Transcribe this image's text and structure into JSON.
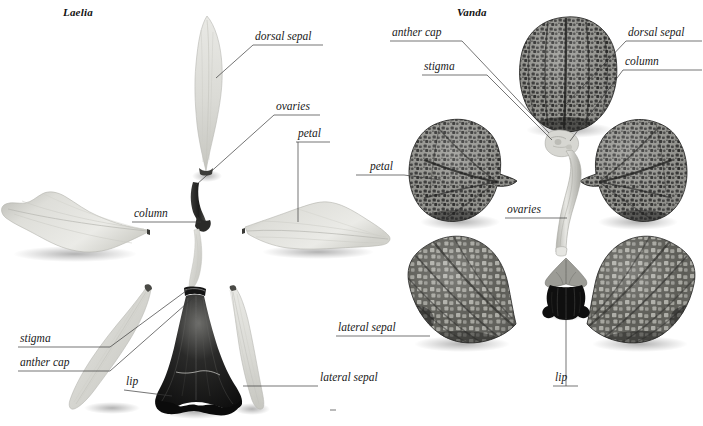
{
  "plate": {
    "width": 703,
    "height": 426,
    "background_color": "#ffffff",
    "description": "Comparative botanical dissection plate of two orchid genera showing separated floral parts"
  },
  "genera": [
    {
      "id": "laelia",
      "name": "Laelia",
      "x": 63,
      "y": 7
    },
    {
      "id": "vanda",
      "name": "Vanda",
      "x": 457,
      "y": 7
    }
  ],
  "labels": {
    "laelia": [
      {
        "id": "dorsal-sepal",
        "text": "dorsal sepal",
        "x": 255,
        "y": 31,
        "underline_x1": 253,
        "underline_x2": 323,
        "underline_y": 45,
        "leader": "M253,45 L216,78"
      },
      {
        "id": "ovaries",
        "text": "ovaries",
        "x": 276,
        "y": 101,
        "underline_x1": 274,
        "underline_x2": 320,
        "underline_y": 115,
        "leader": "M274,115 L196,185"
      },
      {
        "id": "petal",
        "text": "petal",
        "x": 298,
        "y": 128,
        "underline_x1": 296,
        "underline_x2": 330,
        "underline_y": 142,
        "leader": "M298,142 L298,222"
      },
      {
        "id": "column",
        "text": "column",
        "x": 134,
        "y": 208,
        "underline_x1": 132,
        "underline_x2": 177,
        "underline_y": 222,
        "leader": "M177,222 L197,222"
      },
      {
        "id": "stigma",
        "text": "stigma",
        "x": 20,
        "y": 333,
        "underline_x1": 18,
        "underline_x2": 110,
        "underline_y": 347,
        "leader": "M110,347 L190,290"
      },
      {
        "id": "anther-cap",
        "text": "anther cap",
        "x": 20,
        "y": 356,
        "underline_x1": 18,
        "underline_x2": 110,
        "underline_y": 371,
        "leader": "M110,371 L193,296"
      },
      {
        "id": "lip",
        "text": "lip",
        "x": 126,
        "y": 376,
        "underline_x1": 124,
        "underline_x2": 146,
        "underline_y": 390,
        "leader": "M146,390 L172,397"
      },
      {
        "id": "lateral-sepal",
        "text": "lateral sepal",
        "x": 320,
        "y": 372,
        "underline_x1": 250,
        "underline_x2": 318,
        "underline_y": 386,
        "leader": "M250,386 L243,386"
      }
    ],
    "vanda": [
      {
        "id": "anther-cap",
        "text": "anther cap",
        "x": 392,
        "y": 27,
        "underline_x1": 390,
        "underline_x2": 462,
        "underline_y": 41,
        "leader": "M462,41 L548,132"
      },
      {
        "id": "stigma",
        "text": "stigma",
        "x": 424,
        "y": 61,
        "underline_x1": 422,
        "underline_x2": 486,
        "underline_y": 75,
        "leader": "M486,75 L551,139"
      },
      {
        "id": "dorsal-sepal",
        "text": "dorsal sepal",
        "x": 628,
        "y": 27,
        "underline_x1": 626,
        "underline_x2": 700,
        "underline_y": 41,
        "leader": "M626,41 L567,103"
      },
      {
        "id": "column",
        "text": "column",
        "x": 625,
        "y": 56,
        "underline_x1": 623,
        "underline_x2": 700,
        "underline_y": 70,
        "leader": "M623,70 L569,140"
      },
      {
        "id": "petal",
        "text": "petal",
        "x": 370,
        "y": 161,
        "underline_x1": 356,
        "underline_x2": 400,
        "underline_y": 175,
        "leader": "M400,175 L437,180"
      },
      {
        "id": "ovaries",
        "text": "ovaries",
        "x": 507,
        "y": 204,
        "underline_x1": 505,
        "underline_x2": 551,
        "underline_y": 218,
        "leader": "M551,218 L566,218"
      },
      {
        "id": "lateral-sepal",
        "text": "lateral sepal",
        "x": 338,
        "y": 322,
        "underline_x1": 336,
        "underline_x2": 410,
        "underline_y": 336,
        "leader": "M410,336 L427,336"
      },
      {
        "id": "lip",
        "text": "lip",
        "x": 555,
        "y": 372,
        "underline_x1": 553,
        "underline_x2": 578,
        "underline_y": 386,
        "leader": "M566,386 L566,315"
      }
    ]
  },
  "specimens": {
    "laelia": [
      {
        "id": "laelia-dorsal-sepal",
        "part": "dorsal sepal",
        "tone": "light"
      },
      {
        "id": "laelia-left-petal",
        "part": "petal",
        "tone": "light"
      },
      {
        "id": "laelia-right-petal",
        "part": "petal",
        "tone": "light"
      },
      {
        "id": "laelia-column",
        "part": "column",
        "tone": "dark"
      },
      {
        "id": "laelia-left-lateral-sepal",
        "part": "lateral sepal",
        "tone": "light"
      },
      {
        "id": "laelia-right-lateral-sepal",
        "part": "lateral sepal",
        "tone": "light"
      },
      {
        "id": "laelia-lip",
        "part": "lip",
        "tone": "dark"
      }
    ],
    "vanda": [
      {
        "id": "vanda-dorsal-sepal",
        "part": "dorsal sepal",
        "tone": "dark-mottled"
      },
      {
        "id": "vanda-left-petal",
        "part": "petal",
        "tone": "dark-mottled"
      },
      {
        "id": "vanda-right-petal",
        "part": "petal",
        "tone": "dark-mottled"
      },
      {
        "id": "vanda-column",
        "part": "column",
        "tone": "light"
      },
      {
        "id": "vanda-left-lateral-sepal",
        "part": "lateral sepal",
        "tone": "dark-mottled"
      },
      {
        "id": "vanda-right-lateral-sepal",
        "part": "lateral sepal",
        "tone": "dark-mottled"
      },
      {
        "id": "vanda-lip",
        "part": "lip",
        "tone": "very-dark"
      }
    ]
  },
  "colors": {
    "background": "#ffffff",
    "label_text": "#1a1a1a",
    "leader_line": "#3a3a3a",
    "light_tissue": "#dcdcd8",
    "light_tissue_shade": "#c0c0bb",
    "mid_tissue": "#9a9a95",
    "dark_tissue": "#4a4a48",
    "very_dark_tissue": "#171717",
    "mottle_dark": "#2f2f2e",
    "shadow": "#bdbdbd"
  }
}
